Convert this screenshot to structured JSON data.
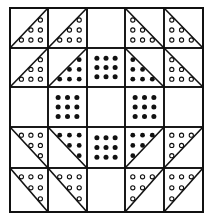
{
  "colors": {
    "ink": "#111111",
    "background": "#ffffff"
  },
  "grid": {
    "rows": 5,
    "cols": 5,
    "x": [
      10,
      48,
      87,
      125,
      164,
      203
    ],
    "y": [
      8,
      48,
      87,
      127,
      168,
      212
    ]
  },
  "cells": [
    [
      "hst-lr-open",
      "hst-lr-open",
      "blank",
      "hst-ll-open",
      "hst-ll-open"
    ],
    [
      "hst-lr-open",
      "hst-lr-filled",
      "square-filled",
      "hst-ll-filled",
      "hst-ll-open"
    ],
    [
      "blank",
      "square-filled",
      "blank",
      "square-filled",
      "blank"
    ],
    [
      "hst-ur-open",
      "hst-ur-filled",
      "square-filled",
      "hst-ul-filled",
      "hst-ul-open"
    ],
    [
      "hst-ur-open",
      "hst-ur-open",
      "blank",
      "hst-ul-open",
      "hst-ul-open"
    ]
  ],
  "legend": {
    "hst": "half-square triangle; suffix = dotted corner (lr lower-right, ll lower-left, ur upper-right, ul upper-left)",
    "open": "small open circles",
    "filled": "solid dots"
  }
}
